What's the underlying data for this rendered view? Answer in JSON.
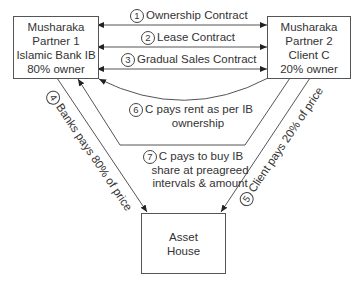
{
  "diagram": {
    "nodes": {
      "partner1": {
        "lines": [
          "Musharaka",
          "Partner 1",
          "Islamic Bank IB",
          "80% owner"
        ]
      },
      "partner2": {
        "lines": [
          "Musharaka",
          "Partner 2",
          "Client C",
          "20% owner"
        ]
      },
      "asset": {
        "lines": [
          "Asset",
          "House"
        ]
      }
    },
    "edges": [
      {
        "num": "1",
        "text": "Ownership Contract"
      },
      {
        "num": "2",
        "text": "Lease Contract"
      },
      {
        "num": "3",
        "text": "Gradual Sales Contract"
      },
      {
        "num": "4",
        "text": "Banks pays 80% of price"
      },
      {
        "num": "5",
        "text": "Client pays 20% of price"
      },
      {
        "num": "6",
        "line1": "C pays rent as per IB",
        "line2": "ownership"
      },
      {
        "num": "7",
        "line1": "C pays to buy IB",
        "line2": "share at preagreed",
        "line3": "intervals & amount"
      }
    ],
    "colors": {
      "line": "#555555",
      "text": "#333333",
      "background": "#ffffff"
    }
  }
}
